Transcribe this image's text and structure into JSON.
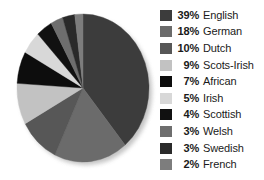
{
  "chart_data": {
    "type": "pie",
    "title": "",
    "subtitle": "",
    "xlabel": "",
    "ylabel": "",
    "legend_position": "right",
    "grid": false,
    "units": "percent",
    "start_angle_deg": 0,
    "direction": "clockwise",
    "categories": [
      "English",
      "German",
      "Dutch",
      "Scots-Irish",
      "African",
      "Irish",
      "Scottish",
      "Welsh",
      "Swedish",
      "French"
    ],
    "values": [
      39,
      18,
      10,
      9,
      7,
      5,
      4,
      3,
      3,
      2
    ],
    "colors": [
      "#3c3c3c",
      "#6b6b6b",
      "#575757",
      "#c2c2c2",
      "#0d0d0d",
      "#d8d8d8",
      "#111111",
      "#6e6e6e",
      "#2a2a2a",
      "#7d7d7d"
    ],
    "slices": [
      {
        "label": "English",
        "value": 39,
        "percent_text": "39%",
        "color": "#3c3c3c"
      },
      {
        "label": "German",
        "value": 18,
        "percent_text": "18%",
        "color": "#6b6b6b"
      },
      {
        "label": "Dutch",
        "value": 10,
        "percent_text": "10%",
        "color": "#575757"
      },
      {
        "label": "Scots-Irish",
        "value": 9,
        "percent_text": "9%",
        "color": "#c2c2c2"
      },
      {
        "label": "African",
        "value": 7,
        "percent_text": "7%",
        "color": "#0d0d0d"
      },
      {
        "label": "Irish",
        "value": 5,
        "percent_text": "5%",
        "color": "#d8d8d8"
      },
      {
        "label": "Scottish",
        "value": 4,
        "percent_text": "4%",
        "color": "#111111"
      },
      {
        "label": "Welsh",
        "value": 3,
        "percent_text": "3%",
        "color": "#6e6e6e"
      },
      {
        "label": "Swedish",
        "value": 3,
        "percent_text": "3%",
        "color": "#2a2a2a"
      },
      {
        "label": "French",
        "value": 2,
        "percent_text": "2%",
        "color": "#7d7d7d"
      }
    ]
  },
  "legend": {
    "items": [
      {
        "percent": "39%",
        "label": "English",
        "color": "#3c3c3c"
      },
      {
        "percent": "18%",
        "label": "German",
        "color": "#6b6b6b"
      },
      {
        "percent": "10%",
        "label": "Dutch",
        "color": "#575757"
      },
      {
        "percent": "9%",
        "label": "Scots-Irish",
        "color": "#c2c2c2"
      },
      {
        "percent": "7%",
        "label": "African",
        "color": "#0d0d0d"
      },
      {
        "percent": "5%",
        "label": "Irish",
        "color": "#d8d8d8"
      },
      {
        "percent": "4%",
        "label": "Scottish",
        "color": "#111111"
      },
      {
        "percent": "3%",
        "label": "Welsh",
        "color": "#6e6e6e"
      },
      {
        "percent": "3%",
        "label": "Swedish",
        "color": "#2a2a2a"
      },
      {
        "percent": "2%",
        "label": "French",
        "color": "#7d7d7d"
      }
    ]
  }
}
